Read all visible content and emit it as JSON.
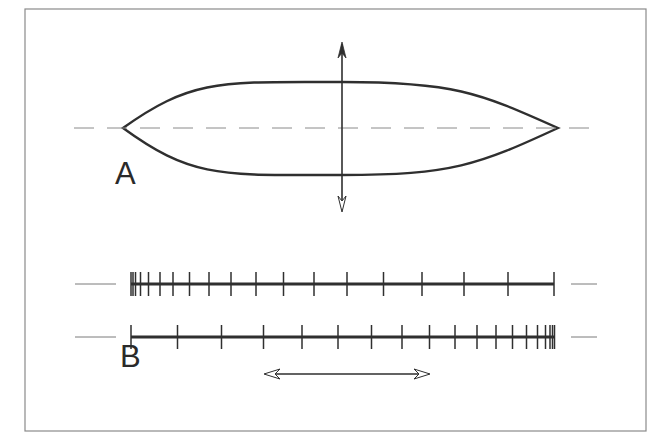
{
  "figure": {
    "frame": {
      "x": 25,
      "y": 9,
      "width": 621,
      "height": 422,
      "stroke": "#8a8a8a"
    },
    "colors": {
      "ink": "#2f2f2f",
      "dash": "#8a8a8a",
      "thin": "#7a7a7a"
    },
    "panel_a": {
      "label": "A",
      "label_pos": {
        "x": 115,
        "y": 184
      },
      "axis": {
        "y": 128,
        "x1": 74,
        "x2": 596,
        "dash": "20 13"
      },
      "lens": {
        "left_tip": [
          123,
          128
        ],
        "right_tip": [
          558,
          128
        ],
        "top_y": 82,
        "bottom_y": 175,
        "apex_x": 342
      },
      "vertical_arrow": {
        "x": 342,
        "y1": 42,
        "y2": 212,
        "heads": "both"
      }
    },
    "panel_b": {
      "label": "B",
      "label_pos": {
        "x": 120,
        "y": 367
      },
      "line_top": {
        "y": 284,
        "x1": 131,
        "x2": 554,
        "side_dashes": [
          [
            75,
            116
          ],
          [
            571,
            597
          ]
        ],
        "tick_half_height": 12,
        "ticks": [
          131,
          133,
          135.5,
          140.5,
          148.5,
          160,
          173,
          189.5,
          209,
          231,
          256,
          283.5,
          314,
          347,
          383.5,
          422,
          464,
          508,
          554
        ]
      },
      "line_bottom": {
        "y": 337,
        "x1": 131,
        "x2": 554,
        "side_dashes": [
          [
            75,
            116
          ],
          [
            571,
            597
          ]
        ],
        "tick_half_height": 12,
        "ticks": [
          131,
          177.5,
          221.5,
          263.5,
          302,
          338,
          371.5,
          402,
          429.5,
          455,
          477,
          496,
          512.5,
          526.5,
          537.5,
          545.5,
          550,
          552.5,
          554.5
        ]
      },
      "horizontal_arrow": {
        "y": 374,
        "x1": 264,
        "x2": 430,
        "heads": "both"
      }
    }
  }
}
